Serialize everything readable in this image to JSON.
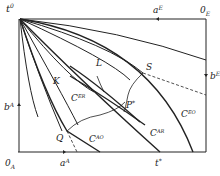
{
  "diagram": {
    "labels": {
      "top_left": "t",
      "top_left_sup": "0",
      "top_mid": "a",
      "top_mid_sup": "E",
      "top_right": "0",
      "top_right_sub": "E",
      "right_mid": "b",
      "right_mid_sup": "E",
      "left_mid": "b",
      "left_mid_sup": "A",
      "bottom_left": "0",
      "bottom_left_sub": "A",
      "bottom_mid": "a",
      "bottom_mid_sup": "A",
      "bottom_right": "t",
      "bottom_right_sup": "*",
      "K": "K",
      "L": "L",
      "S": "S",
      "Q": "Q",
      "P": "P",
      "P_sup": "*",
      "C_ER": "C",
      "C_ER_sup": "ER",
      "C_AO": "C",
      "C_AO_sup": "AO",
      "C_AR": "C",
      "C_AR_sup": "AR",
      "C_EO": "C",
      "C_EO_sup": "EO"
    },
    "colors": {
      "line": "#222222",
      "background": "#ffffff"
    }
  }
}
